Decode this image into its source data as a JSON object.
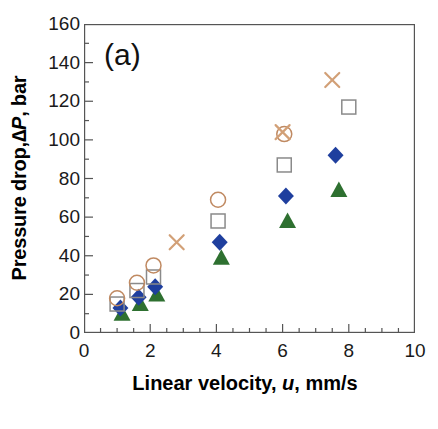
{
  "figure": {
    "panel_label": "(a)"
  },
  "axes": {
    "x": {
      "title_prefix": "Linear velocity, ",
      "title_italic": "u",
      "title_suffix": ", mm/s",
      "min": 0,
      "max": 10,
      "major_step": 2,
      "minor_step": 0.5,
      "tick_labels": [
        "0",
        "2",
        "4",
        "6",
        "8",
        "10"
      ],
      "tick_values": [
        0,
        2,
        4,
        6,
        8,
        10
      ]
    },
    "y": {
      "title_prefix": "Pressure drop, ",
      "title_italic": "∆P",
      "title_suffix": ", bar",
      "min": 0,
      "max": 160,
      "major_step": 20,
      "minor_step": 10,
      "tick_labels": [
        "0",
        "20",
        "40",
        "60",
        "80",
        "100",
        "120",
        "140",
        "160"
      ],
      "tick_values": [
        0,
        20,
        40,
        60,
        80,
        100,
        120,
        140,
        160
      ]
    }
  },
  "colors": {
    "circle": "#c08a62",
    "square": "#8a8a8a",
    "diamond": "#1f3f9e",
    "triangle": "#2e7030",
    "cross": "#d2a077",
    "axis": "#555555",
    "text": "#111111"
  },
  "chart_data": {
    "type": "scatter",
    "title": "(a)",
    "xlabel": "Linear velocity, u, mm/s",
    "ylabel": "Pressure drop, ∆P, bar",
    "xlim": [
      0,
      10
    ],
    "ylim": [
      0,
      160
    ],
    "grid": false,
    "legend": "none",
    "series": [
      {
        "name": "open-circle",
        "marker": "circle-open",
        "color": "#c08a62",
        "points": [
          {
            "x": 1.0,
            "y": 18
          },
          {
            "x": 1.6,
            "y": 26
          },
          {
            "x": 2.1,
            "y": 35
          },
          {
            "x": 4.05,
            "y": 69
          },
          {
            "x": 6.05,
            "y": 103
          }
        ]
      },
      {
        "name": "open-square",
        "marker": "square-open",
        "color": "#8a8a8a",
        "points": [
          {
            "x": 1.0,
            "y": 15
          },
          {
            "x": 1.6,
            "y": 22
          },
          {
            "x": 2.1,
            "y": 29
          },
          {
            "x": 4.05,
            "y": 58
          },
          {
            "x": 6.05,
            "y": 87
          },
          {
            "x": 8.0,
            "y": 117
          }
        ]
      },
      {
        "name": "filled-diamond",
        "marker": "diamond-filled",
        "color": "#1f3f9e",
        "points": [
          {
            "x": 1.1,
            "y": 13
          },
          {
            "x": 1.65,
            "y": 18.5
          },
          {
            "x": 2.15,
            "y": 24
          },
          {
            "x": 4.1,
            "y": 47
          },
          {
            "x": 6.1,
            "y": 71
          },
          {
            "x": 7.6,
            "y": 92
          }
        ]
      },
      {
        "name": "filled-triangle",
        "marker": "triangle-filled",
        "color": "#2e7030",
        "points": [
          {
            "x": 1.15,
            "y": 10
          },
          {
            "x": 1.7,
            "y": 15
          },
          {
            "x": 2.2,
            "y": 20
          },
          {
            "x": 4.15,
            "y": 39
          },
          {
            "x": 6.15,
            "y": 58
          },
          {
            "x": 7.7,
            "y": 74
          }
        ]
      },
      {
        "name": "cross",
        "marker": "x-cross",
        "color": "#d2a077",
        "points": [
          {
            "x": 2.8,
            "y": 47
          },
          {
            "x": 6.0,
            "y": 104
          },
          {
            "x": 7.5,
            "y": 131
          }
        ]
      }
    ]
  }
}
